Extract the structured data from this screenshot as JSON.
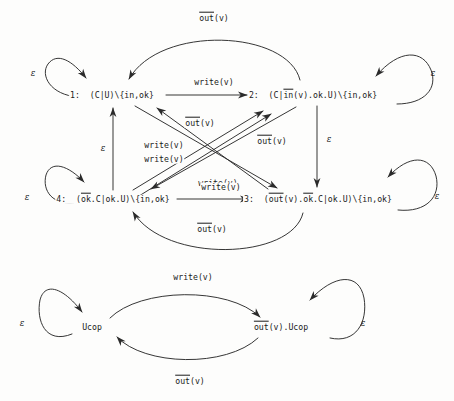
{
  "diagram": {
    "stroke_color": "#2b2b2b",
    "background_color": "#fdfdfc"
  },
  "upper_graph": {
    "nodes": [
      {
        "id": "n1",
        "index": "1:",
        "expr_plain": "(C|U)\\{in,ok}",
        "parts": [
          {
            "text": "1:  (C|U)\\{in,ok}",
            "overline": false
          }
        ],
        "x": 112,
        "y": 95
      },
      {
        "id": "n2",
        "index": "2:",
        "expr_plain": "(C|in(v).ok.U)\\{in,ok}",
        "parts": [
          {
            "text": "2:  (C|",
            "overline": false
          },
          {
            "text": "in",
            "overline": true
          },
          {
            "text": "(v).ok.U)\\{in,ok}",
            "overline": false
          }
        ],
        "x": 313,
        "y": 95
      },
      {
        "id": "n3",
        "index": "3:",
        "expr_plain": "(out(v).ok.C|ok.U)\\{in,ok}",
        "parts": [
          {
            "text": "3:  (",
            "overline": false
          },
          {
            "text": "out",
            "overline": true
          },
          {
            "text": "(v).",
            "overline": false
          },
          {
            "text": "ok",
            "overline": true
          },
          {
            "text": ".C|ok.U)\\{in,ok}",
            "overline": false
          }
        ],
        "x": 318,
        "y": 199
      },
      {
        "id": "n4",
        "index": "4:",
        "expr_plain": "(ok.C|ok.U)\\{in,ok}",
        "parts": [
          {
            "text": "4:  (",
            "overline": false
          },
          {
            "text": "ok",
            "overline": true
          },
          {
            "text": ".C|ok.U)\\{in,ok}",
            "overline": false
          }
        ],
        "x": 113,
        "y": 199
      }
    ],
    "edges": [
      {
        "id": "e-1-2",
        "from": "n1",
        "to": "n2",
        "label_plain": "write(v)",
        "label_x": 214,
        "label_y": 82
      },
      {
        "id": "e-4-3",
        "from": "n4",
        "to": "n3",
        "label_plain": "write(v)",
        "label_x": 221,
        "label_y": 187
      },
      {
        "id": "e-2-1-arc",
        "from": "n2",
        "to": "n1",
        "label_plain": "out(v)",
        "label_overline": "out",
        "label_x": 214,
        "label_y": 18
      },
      {
        "id": "e-3-4-arc",
        "from": "n3",
        "to": "n4",
        "label_plain": "out(v)",
        "label_overline": "out",
        "label_x": 212,
        "label_y": 229
      },
      {
        "id": "e-3-1-diag",
        "from": "n3",
        "to": "n1",
        "label_plain": "out(v)",
        "label_overline": "out",
        "label_x": 200,
        "label_y": 123
      },
      {
        "id": "e-2-4-diag",
        "from": "n2",
        "to": "n4",
        "label_plain": "out(v)",
        "label_overline": "out",
        "label_x": 272,
        "label_y": 141
      },
      {
        "id": "e-4-2-diag-a",
        "from": "n4",
        "to": "n2",
        "label_plain": "write(v)",
        "label_x": 164,
        "label_y": 145
      },
      {
        "id": "e-4-2-diag-b",
        "from": "n4",
        "to": "n2",
        "label_plain": "write(v)",
        "label_x": 164,
        "label_y": 159
      },
      {
        "id": "e-1-3-diag",
        "from": "n1",
        "to": "n3",
        "label_plain": "write(v)",
        "label_x": 218,
        "label_y": 183
      },
      {
        "id": "e-4-1-vert",
        "from": "n4",
        "to": "n1",
        "label_plain": "ε",
        "label_x": 103,
        "label_y": 148
      },
      {
        "id": "e-2-3-vert",
        "from": "n2",
        "to": "n3",
        "label_plain": "ε",
        "label_x": 317,
        "label_y": 139
      }
    ],
    "self_loops": [
      {
        "id": "loop-n1",
        "node": "n1",
        "label_plain": "ε",
        "label_x": 33,
        "label_y": 73,
        "side": "left"
      },
      {
        "id": "loop-n2",
        "node": "n2",
        "label_plain": "ε",
        "label_x": 433,
        "label_y": 73,
        "side": "right"
      },
      {
        "id": "loop-n4",
        "node": "n4",
        "label_plain": "ε",
        "label_x": 27,
        "label_y": 197,
        "side": "left"
      },
      {
        "id": "loop-n3",
        "node": "n3",
        "label_plain": "ε",
        "label_x": 437,
        "label_y": 196,
        "side": "right"
      }
    ]
  },
  "lower_graph": {
    "nodes": [
      {
        "id": "m1",
        "expr_plain": "Ucop",
        "parts": [
          {
            "text": "Ucop",
            "overline": false
          }
        ],
        "x": 92,
        "y": 327
      },
      {
        "id": "m2",
        "expr_plain": "out(v).Ucop",
        "parts": [
          {
            "text": "",
            "overline": false
          },
          {
            "text": "out",
            "overline": true
          },
          {
            "text": "(v).Ucop",
            "overline": false
          }
        ],
        "x": 281,
        "y": 327
      }
    ],
    "edges": [
      {
        "id": "me-1-2",
        "from": "m1",
        "to": "m2",
        "label_plain": "write(v)",
        "label_x": 193,
        "label_y": 277
      },
      {
        "id": "me-2-1",
        "from": "m2",
        "to": "m1",
        "label_plain": "out(v)",
        "label_overline": "out",
        "label_x": 190,
        "label_y": 381
      }
    ],
    "self_loops": [
      {
        "id": "loop-m1",
        "node": "m1",
        "label_plain": "ε",
        "label_x": 22,
        "label_y": 323,
        "side": "left"
      },
      {
        "id": "loop-m2",
        "node": "m2",
        "label_plain": "ε",
        "label_x": 363,
        "label_y": 323,
        "side": "right"
      }
    ]
  }
}
